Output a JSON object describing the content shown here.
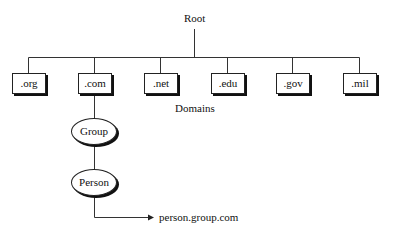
{
  "diagram": {
    "root_label": "Root",
    "domains_label": "Domains",
    "domains": [
      ".org",
      ".com",
      ".net",
      ".edu",
      ".gov",
      ".mil"
    ],
    "subtree": {
      "parent": ".com",
      "nodes": [
        "Group",
        "Person"
      ]
    },
    "result_label": "person.group.com"
  }
}
